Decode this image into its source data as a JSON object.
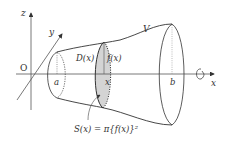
{
  "diagram": {
    "axes": {
      "x_label": "x",
      "y_label": "y",
      "z_label": "z",
      "origin_label": "O"
    },
    "labels": {
      "solid": "V",
      "lower_bound": "a",
      "upper_bound": "b",
      "cross_section_position": "x",
      "cross_section_region": "D(x)",
      "radius": "f(x)",
      "area_formula": "S(x) = π{f(x)}²"
    },
    "rotation_icon": "rotation-arrow-icon",
    "colors": {
      "line": "#333333",
      "axis": "#555555",
      "cross_section_fill": "#d4d4d4"
    }
  }
}
